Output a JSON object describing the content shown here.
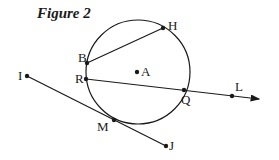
{
  "figure": {
    "title": "Figure 2",
    "circle": {
      "center_label": "A"
    },
    "points": {
      "H": "H",
      "B": "B",
      "R": "R",
      "A": "A",
      "Q": "Q",
      "L": "L",
      "I": "I",
      "M": "M",
      "J": "J"
    },
    "segments": [
      "BH",
      "IJ"
    ],
    "rays": [
      "RL"
    ],
    "colors": {
      "stroke": "#1a1a1a",
      "background": "#ffffff"
    }
  }
}
